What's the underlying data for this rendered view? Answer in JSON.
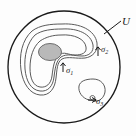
{
  "figure": {
    "type": "mathematical-region-diagram",
    "background_color": "#fdfdfd",
    "stroke_color": "#1a1a1a",
    "curve_color": "#4d4d4d",
    "shaded_fill": "#b9b9b9",
    "shaded_stroke": "#6e6e6e",
    "labels": {
      "domain": "U",
      "contour_1": "σ",
      "contour_1_sub": "1",
      "contour_2": "σ",
      "contour_2_sub": "2",
      "contour_3": "σ",
      "contour_3_sub": "3"
    },
    "elements": [
      {
        "name": "outer-boundary-circle",
        "label": "U",
        "shape": "circle",
        "cx": 64,
        "cy": 67,
        "r": 56
      },
      {
        "name": "contour-sigma-1",
        "label": "σ1",
        "shape": "closed-kidney-curve"
      },
      {
        "name": "contour-sigma-2",
        "label": "σ2",
        "shape": "closed-kidney-curve-outer"
      },
      {
        "name": "contour-sigma-3",
        "label": "σ3",
        "shape": "small-closed-loop"
      },
      {
        "name": "shaded-hole",
        "shape": "ellipse",
        "cx": 50,
        "cy": 52,
        "rx": 11,
        "ry": 8
      }
    ]
  }
}
